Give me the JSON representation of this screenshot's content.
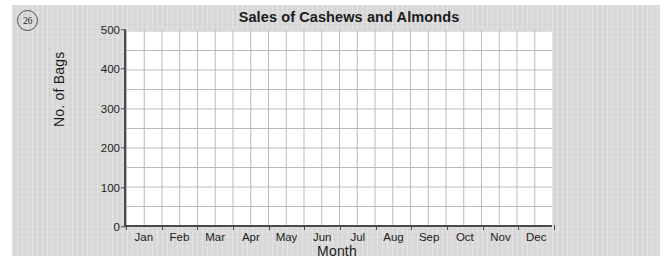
{
  "question_number": "26",
  "colors": {
    "card_background": "#d9d9d9",
    "plot_background": "#ffffff",
    "axis": "#4a4a4a",
    "gridline": "#b9b9b9",
    "text": "#1b1b1b"
  },
  "chart_data": {
    "type": "line",
    "title": "Sales of Cashews and Almonds",
    "xlabel": "Month",
    "ylabel": "No. of Bags",
    "categories": [
      "Jan",
      "Feb",
      "Mar",
      "Apr",
      "May",
      "Jun",
      "Jul",
      "Aug",
      "Sep",
      "Oct",
      "Nov",
      "Dec"
    ],
    "series": [],
    "yticks": [
      "0",
      "100",
      "200",
      "300",
      "400",
      "500"
    ],
    "ytick_values": [
      0,
      100,
      200,
      300,
      400,
      500
    ],
    "ylim": [
      0,
      500
    ],
    "y_minor_step": 50,
    "grid": true,
    "legend": "none",
    "note": "Empty grid — no data plotted; blank chart for student to complete."
  }
}
